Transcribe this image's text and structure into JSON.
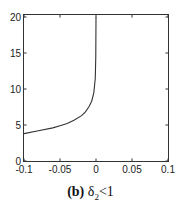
{
  "chart_data": {
    "type": "line",
    "title": "",
    "caption": {
      "label": "(b)",
      "text_symbol": "δ",
      "subscript": "2",
      "relation": "<1"
    },
    "xlabel": "",
    "ylabel": "",
    "xlim": [
      -0.1,
      0.1
    ],
    "ylim": [
      0,
      20
    ],
    "x_ticks": [
      "-0.1",
      "-0.05",
      "0",
      "0.05",
      "0.1"
    ],
    "y_ticks": [
      "0",
      "5",
      "10",
      "15",
      "20"
    ],
    "grid": false,
    "legend": null,
    "series": [
      {
        "name": "curve",
        "x": [
          -0.1,
          -0.08,
          -0.06,
          -0.05,
          -0.04,
          -0.03,
          -0.02,
          -0.015,
          -0.01,
          -0.006,
          -0.003,
          -0.001,
          -0.0003,
          0.0
        ],
        "y": [
          3.8,
          4.2,
          4.6,
          4.9,
          5.2,
          5.7,
          6.3,
          6.8,
          7.5,
          8.3,
          9.5,
          11.5,
          14.5,
          20.0
        ]
      }
    ]
  }
}
